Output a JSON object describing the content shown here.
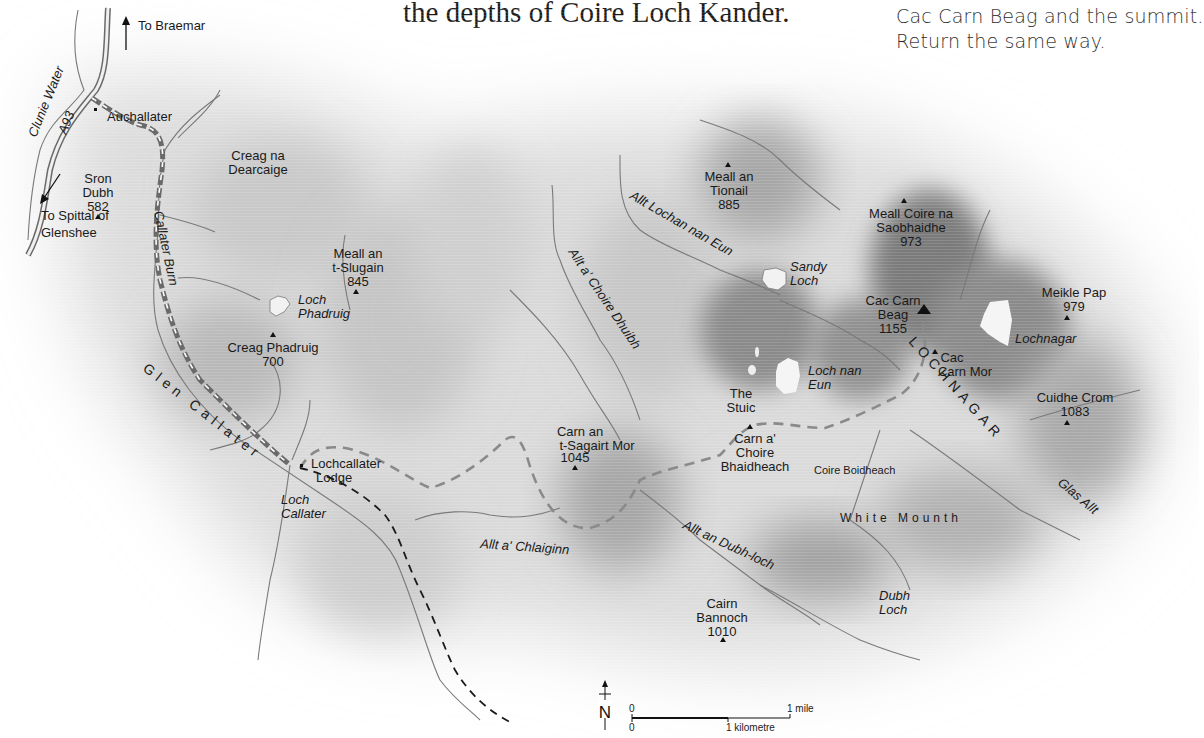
{
  "text": {
    "line_fragment": "the depths of Coire Loch Kander.",
    "route_lines": [
      "Cac Carn Beag and the summit.",
      "Return the same way."
    ]
  },
  "directions": {
    "north": "To Braemar",
    "south_line1": "To Spittal of",
    "south_line2": "Glenshee"
  },
  "roads": {
    "a93": "A93"
  },
  "places": {
    "auchallater": "Auchallater",
    "lochcallater_lodge_1": "Lochcallater",
    "lochcallater_lodge_2": "Lodge"
  },
  "peaks": [
    {
      "name1": "Sron",
      "name2": "Dubh",
      "height": "582"
    },
    {
      "name1": "Creag na",
      "name2": "Dearcaige",
      "height": ""
    },
    {
      "name1": "Meall an",
      "name2": "t-Slugain",
      "height": "845"
    },
    {
      "name1": "Creag Phadruig",
      "name2": "",
      "height": "700"
    },
    {
      "name1": "Meall an",
      "name2": "Tionail",
      "height": "885"
    },
    {
      "name1": "Meall Coire na",
      "name2": "Saobhaidhe",
      "height": "973"
    },
    {
      "name1": "Cac Carn",
      "name2": "Beag",
      "height": "1155"
    },
    {
      "name1": "Meikle Pap",
      "name2": "",
      "height": "979"
    },
    {
      "name1": "Cac",
      "name2": "Carn Mor",
      "height": ""
    },
    {
      "name1": "Cuidhe Crom",
      "name2": "",
      "height": "1083"
    },
    {
      "name1": "Carn an",
      "name2": "t-Sagairt Mor",
      "height": "1045"
    },
    {
      "name1": "Carn a'",
      "name2": "Choire",
      "name3": "Bhaidheach",
      "height": ""
    },
    {
      "name1": "Cairn",
      "name2": "Bannoch",
      "height": "1010"
    },
    {
      "name1": "The",
      "name2": "Stuic",
      "height": ""
    }
  ],
  "waters": {
    "clunie_water": "Clunie Water",
    "callater_burn": "Callater Burn",
    "loch_phadruig_1": "Loch",
    "loch_phadruig_2": "Phadruig",
    "loch_callater_1": "Loch",
    "loch_callater_2": "Callater",
    "allt_lochan_nan_eun": "Allt Lochan nan Eun",
    "allt_a_choire_dhuibh": "Allt a' Choire Dhuibh",
    "sandy_loch_1": "Sandy",
    "sandy_loch_2": "Loch",
    "loch_nan_eun_1": "Loch nan",
    "loch_nan_eun_2": "Eun",
    "lochnagar_loch": "Lochnagar",
    "allt_a_chlaiginn": "Allt a' Chlaiginn",
    "allt_an_dubh_loch": "Allt an Dubh-loch",
    "dubh_loch_1": "Dubh",
    "dubh_loch_2": "Loch",
    "glas_allt": "Glas Allt"
  },
  "areas": {
    "glen_callater": "Glen Callater",
    "lochnagar": "LOCHNAGAR",
    "white_mounth": "White Mounth",
    "coire_boidheach": "Coire Boidheach"
  },
  "scale": {
    "north": "N",
    "zero_top": "0",
    "zero_bottom": "0",
    "mile": "1 mile",
    "kilometre": "1 kilometre"
  },
  "colors": {
    "route": "#8a8a8a",
    "alt_route": "#1a1a1a",
    "river": "#7a7a7a",
    "relief_dark": "#5a5a5a"
  }
}
